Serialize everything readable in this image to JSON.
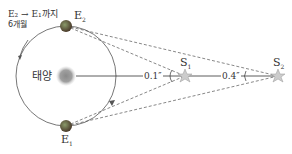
{
  "diagram": {
    "title_note": "E₂ → E₁까지",
    "duration": "6개월",
    "sun_label": "태양",
    "earth_top": "E",
    "earth_top_sub": "2",
    "earth_bottom": "E",
    "earth_bottom_sub": "1",
    "star1": "S",
    "star1_sub": "1",
    "star2": "S",
    "star2_sub": "2",
    "angle1": "0.1″",
    "angle2": "0.4″",
    "colors": {
      "orbit": "#666666",
      "sun": "#999999",
      "earth": "#6b5a3e",
      "star": "#c8c8c8",
      "dash": "#555555"
    }
  }
}
